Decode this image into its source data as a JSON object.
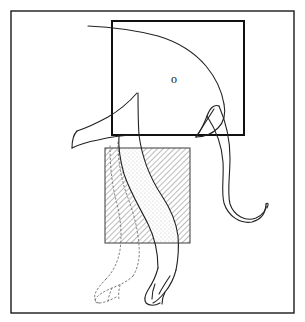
{
  "figure": {
    "canvas": {
      "width": 305,
      "height": 322,
      "background": "#ffffff"
    },
    "frame": {
      "name": "outer-border",
      "x": 11,
      "y": 11,
      "width": 283,
      "height": 302,
      "stroke": "#1a1a1a",
      "stroke_width": 1.4,
      "fill": "none"
    },
    "solid_rectangle": {
      "name": "body-mass-rectangle",
      "x": 112,
      "y": 21,
      "width": 132,
      "height": 114,
      "stroke": "#111111",
      "stroke_width": 2.0,
      "fill": "none"
    },
    "hatched_square": {
      "name": "hatched-study-square",
      "x": 105,
      "y": 148,
      "width": 85,
      "height": 95,
      "stroke": "#333333",
      "stroke_width": 1.0,
      "hatch_angle_deg": 45,
      "hatch_spacing_px": 4,
      "hatch_color": "#555555",
      "fill": "none"
    },
    "stipple_region": {
      "name": "stippled-leg-region",
      "dot_color": "#8a8a8a",
      "dot_spacing_px": 4,
      "description": "fine dot stipple filling the foreleg silhouette inside the square"
    },
    "eye": {
      "name": "elephant-eye",
      "glyph": "o",
      "cx": 174,
      "cy": 79,
      "color": "#111111"
    },
    "strokes": {
      "outline_color": "#222222",
      "outline_width": 1.1,
      "dotted_leg_color": "#777777",
      "dotted_dash": "1.6 2.4"
    },
    "parts": [
      {
        "name": "head-back-curve",
        "style": "solid"
      },
      {
        "name": "forehead-and-brow",
        "style": "solid"
      },
      {
        "name": "trunk-outer-curve",
        "style": "solid"
      },
      {
        "name": "trunk-inner-curve",
        "style": "solid"
      },
      {
        "name": "trunk-tip-hook",
        "style": "solid"
      },
      {
        "name": "ear-lower-edge",
        "style": "solid"
      },
      {
        "name": "belly-line",
        "style": "solid"
      },
      {
        "name": "near-foreleg",
        "style": "solid"
      },
      {
        "name": "near-foot-toes",
        "style": "solid"
      },
      {
        "name": "far-foreleg",
        "style": "dotted"
      },
      {
        "name": "far-foot-toes",
        "style": "dotted"
      }
    ]
  }
}
